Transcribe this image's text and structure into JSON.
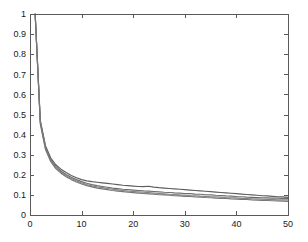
{
  "chart_data": {
    "type": "line",
    "title": "",
    "subtitle": "",
    "xlabel": "",
    "ylabel": "",
    "xlim": [
      0,
      50
    ],
    "ylim": [
      0,
      1
    ],
    "grid": false,
    "legend": null,
    "xticks": [
      0,
      10,
      20,
      30,
      40,
      50
    ],
    "xtick_labels": [
      "0",
      "10",
      "20",
      "30",
      "40",
      "50"
    ],
    "yticks": [
      0,
      0.1,
      0.2,
      0.3,
      0.4,
      0.5,
      0.6,
      0.7,
      0.8,
      0.9,
      1
    ],
    "ytick_labels": [
      "0",
      "0.1",
      "0.2",
      "0.3",
      "0.4",
      "0.5",
      "0.6",
      "0.7",
      "0.8",
      "0.9",
      "1"
    ],
    "x": [
      1,
      2,
      3,
      4,
      5,
      6,
      7,
      8,
      9,
      10,
      11,
      12,
      13,
      14,
      15,
      16,
      17,
      18,
      19,
      20,
      21,
      22,
      23,
      24,
      25,
      26,
      27,
      28,
      29,
      30,
      31,
      32,
      33,
      34,
      35,
      36,
      37,
      38,
      39,
      40,
      41,
      42,
      43,
      44,
      45,
      46,
      47,
      48,
      49,
      50
    ],
    "series": [
      {
        "name": "curve-1",
        "color": "#5e5e5e",
        "values": [
          1.0,
          0.47,
          0.345,
          0.285,
          0.25,
          0.228,
          0.211,
          0.197,
          0.185,
          0.176,
          0.17,
          0.166,
          0.163,
          0.16,
          0.157,
          0.154,
          0.151,
          0.148,
          0.146,
          0.144,
          0.142,
          0.141,
          0.143,
          0.139,
          0.136,
          0.134,
          0.132,
          0.13,
          0.128,
          0.126,
          0.124,
          0.122,
          0.12,
          0.118,
          0.116,
          0.114,
          0.112,
          0.11,
          0.108,
          0.106,
          0.104,
          0.102,
          0.1,
          0.098,
          0.096,
          0.095,
          0.093,
          0.091,
          0.09,
          0.088
        ]
      },
      {
        "name": "curve-2",
        "color": "#6d6d6d",
        "values": [
          1.0,
          0.465,
          0.338,
          0.277,
          0.242,
          0.219,
          0.202,
          0.188,
          0.176,
          0.166,
          0.158,
          0.151,
          0.146,
          0.142,
          0.138,
          0.134,
          0.131,
          0.128,
          0.126,
          0.124,
          0.122,
          0.12,
          0.119,
          0.117,
          0.115,
          0.113,
          0.112,
          0.11,
          0.109,
          0.107,
          0.106,
          0.104,
          0.103,
          0.101,
          0.1,
          0.098,
          0.097,
          0.095,
          0.094,
          0.092,
          0.091,
          0.089,
          0.088,
          0.087,
          0.086,
          0.085,
          0.084,
          0.084,
          0.083,
          0.083
        ]
      },
      {
        "name": "curve-3",
        "color": "#828282",
        "values": [
          1.0,
          0.458,
          0.332,
          0.272,
          0.237,
          0.214,
          0.196,
          0.182,
          0.17,
          0.16,
          0.152,
          0.145,
          0.14,
          0.136,
          0.132,
          0.128,
          0.125,
          0.122,
          0.119,
          0.117,
          0.115,
          0.113,
          0.111,
          0.109,
          0.107,
          0.105,
          0.103,
          0.102,
          0.1,
          0.099,
          0.097,
          0.096,
          0.094,
          0.093,
          0.091,
          0.09,
          0.089,
          0.087,
          0.086,
          0.085,
          0.083,
          0.082,
          0.081,
          0.08,
          0.079,
          0.078,
          0.077,
          0.076,
          0.075,
          0.075
        ]
      },
      {
        "name": "curve-4",
        "color": "#777777",
        "values": [
          1.0,
          0.452,
          0.326,
          0.266,
          0.231,
          0.208,
          0.19,
          0.176,
          0.164,
          0.154,
          0.146,
          0.14,
          0.134,
          0.13,
          0.126,
          0.122,
          0.119,
          0.116,
          0.113,
          0.111,
          0.109,
          0.107,
          0.105,
          0.103,
          0.101,
          0.1,
          0.098,
          0.096,
          0.095,
          0.093,
          0.092,
          0.09,
          0.089,
          0.087,
          0.086,
          0.084,
          0.083,
          0.082,
          0.08,
          0.079,
          0.078,
          0.077,
          0.075,
          0.074,
          0.073,
          0.072,
          0.071,
          0.07,
          0.069,
          0.068
        ]
      }
    ]
  },
  "axes": {
    "frame_color": "#5a5a5a",
    "background": "#ffffff"
  }
}
